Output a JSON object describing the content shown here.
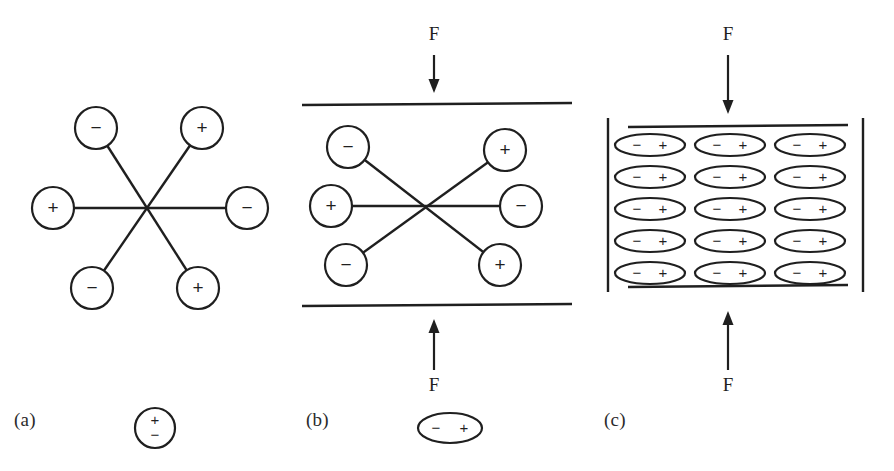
{
  "figure": {
    "background": "#ffffff",
    "ink": "#1f1f1f",
    "width": 894,
    "height": 471
  },
  "symbols": {
    "plus": "+",
    "minus": "−",
    "force": "F"
  },
  "panels": [
    {
      "id": "a",
      "label": "(a)",
      "caption_symbol": "circle-dipole-vertical",
      "description": "randomly oriented dipoles crossing at a common centre, no applied force",
      "center": {
        "x": 148,
        "y": 208
      },
      "charges": [
        {
          "name": "top-left",
          "sign": "−",
          "cx": 96,
          "cy": 128
        },
        {
          "name": "top-right",
          "sign": "+",
          "cx": 202,
          "cy": 128
        },
        {
          "name": "left",
          "sign": "+",
          "cx": 53,
          "cy": 208
        },
        {
          "name": "right",
          "sign": "−",
          "cx": 247,
          "cy": 208
        },
        {
          "name": "bottom-left",
          "sign": "−",
          "cx": 92,
          "cy": 288
        },
        {
          "name": "bottom-right",
          "sign": "+",
          "cx": 198,
          "cy": 288
        }
      ],
      "radius": 21,
      "rods": [
        {
          "name": "rod-horizontal",
          "x1": 53,
          "y1": 208,
          "x2": 247,
          "y2": 208
        },
        {
          "name": "rod-diagonal-down",
          "x1": 96,
          "y1": 128,
          "x2": 198,
          "y2": 288
        },
        {
          "name": "rod-diagonal-up",
          "x1": 92,
          "y1": 288,
          "x2": 202,
          "y2": 128
        }
      ],
      "legend": {
        "symbol": "circle",
        "top_sign": "+",
        "bottom_sign": "−",
        "cx": 155,
        "cy": 428,
        "r": 20
      }
    },
    {
      "id": "b",
      "label": "(b)",
      "caption_symbol": "ellipse-dipole-horizontal",
      "description": "dipoles compressed between two plates by force F",
      "center": {
        "x": 427,
        "y": 205
      },
      "charges": [
        {
          "name": "top-left",
          "sign": "−",
          "cx": 348,
          "cy": 147
        },
        {
          "name": "top-right",
          "sign": "+",
          "cx": 505,
          "cy": 150
        },
        {
          "name": "left",
          "sign": "+",
          "cx": 331,
          "cy": 206
        },
        {
          "name": "right",
          "sign": "−",
          "cx": 521,
          "cy": 206
        },
        {
          "name": "bottom-left",
          "sign": "−",
          "cx": 346,
          "cy": 265
        },
        {
          "name": "bottom-right",
          "sign": "+",
          "cx": 500,
          "cy": 265
        }
      ],
      "radius": 21,
      "rods": [
        {
          "name": "rod-horizontal",
          "x1": 331,
          "y1": 206,
          "x2": 521,
          "y2": 206
        },
        {
          "name": "rod-diagonal-down",
          "x1": 348,
          "y1": 147,
          "x2": 500,
          "y2": 265
        },
        {
          "name": "rod-diagonal-up",
          "x1": 346,
          "y1": 265,
          "x2": 505,
          "y2": 150
        }
      ],
      "plates": [
        {
          "name": "top-plate",
          "x1": 302,
          "y1": 105,
          "x2": 572,
          "y2": 103
        },
        {
          "name": "bottom-plate",
          "x1": 302,
          "y1": 306,
          "x2": 572,
          "y2": 304
        }
      ],
      "forces": [
        {
          "name": "top-force",
          "label": "F",
          "label_x": 434,
          "label_y": 40,
          "shaft_x": 434,
          "shaft_y1": 55,
          "shaft_y2": 84,
          "direction": "down"
        },
        {
          "name": "bottom-force",
          "label": "F",
          "label_x": 434,
          "label_y": 383,
          "shaft_x": 434,
          "shaft_y1": 370,
          "shaft_y2": 328,
          "direction": "up"
        }
      ],
      "legend": {
        "symbol": "ellipse",
        "left_sign": "−",
        "right_sign": "+",
        "cx": 450,
        "cy": 428,
        "rx": 32,
        "ry": 15
      }
    },
    {
      "id": "c",
      "label": "(c)",
      "caption_symbol": "none",
      "description": "fully aligned dipole lattice inside a confined cell under force F",
      "box": {
        "left_bar_x": 608,
        "right_bar_x": 863,
        "bar_top_y": 118,
        "bar_bottom_y": 292,
        "top_plate": {
          "x1": 628,
          "y1": 127,
          "x2": 848,
          "y2": 125
        },
        "bottom_plate": {
          "x1": 628,
          "y1": 287,
          "x2": 848,
          "y2": 285
        }
      },
      "lattice": {
        "rows": 5,
        "columns": 3,
        "column_centers_x": [
          650,
          730,
          810
        ],
        "row_centers_y": [
          145,
          177,
          209,
          241,
          273
        ],
        "ellipse_rx": 35,
        "ellipse_ry": 11,
        "left_sign": "−",
        "right_sign": "+"
      },
      "forces": [
        {
          "name": "top-force",
          "label": "F",
          "label_x": 728,
          "label_y": 40,
          "shaft_x": 728,
          "shaft_y1": 55,
          "shaft_y2": 105,
          "direction": "down"
        },
        {
          "name": "bottom-force",
          "label": "F",
          "label_x": 728,
          "label_y": 383,
          "shaft_x": 728,
          "shaft_y1": 370,
          "shaft_y2": 310,
          "direction": "up"
        }
      ]
    }
  ]
}
